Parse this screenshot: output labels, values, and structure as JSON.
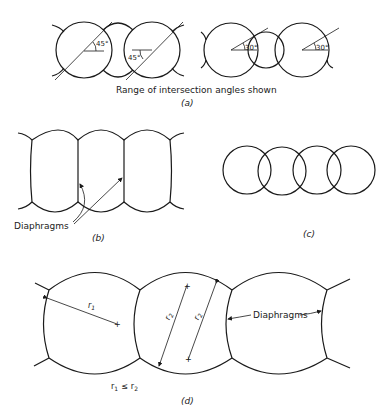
{
  "panel_a": {
    "caption": "Range of intersection angles shown",
    "label": "(a)",
    "angles": [
      "45°",
      "45°",
      "30°",
      "30°"
    ]
  },
  "panel_b": {
    "label": "(b)",
    "callout": "Diaphragms"
  },
  "panel_c": {
    "label": "(c)"
  },
  "panel_d": {
    "label": "(d)",
    "callout": "Diaphragms",
    "r1": "r",
    "r1_sub": "1",
    "r2": "r",
    "r2_sub": "2",
    "relation_r1": "r",
    "relation_r1_sub": "1",
    "relation_op": "≤",
    "relation_r2": "r",
    "relation_r2_sub": "2"
  }
}
